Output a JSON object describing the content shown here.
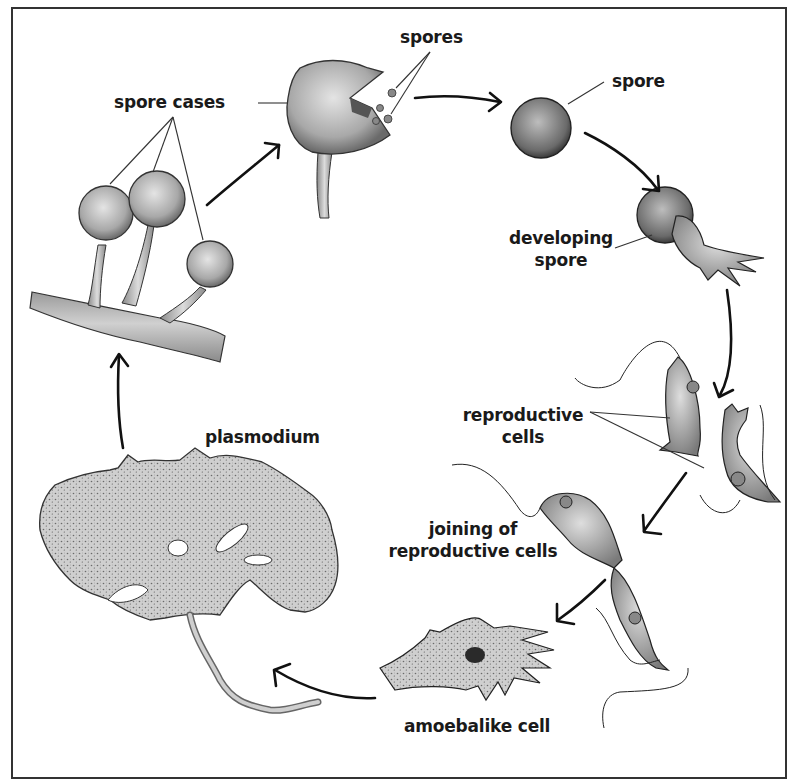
{
  "diagram": {
    "type": "life-cycle",
    "labels": {
      "spore_cases": "spore cases",
      "spores": "spores",
      "spore": "spore",
      "developing_spore_line1": "developing",
      "developing_spore_line2": "spore",
      "reproductive_cells_line1": "reproductive",
      "reproductive_cells_line2": "cells",
      "joining_line1": "joining of",
      "joining_line2": "reproductive cells",
      "amoebalike_cell": "amoebalike cell",
      "plasmodium": "plasmodium"
    },
    "stages": [
      "spore cases",
      "spores",
      "spore",
      "developing spore",
      "reproductive cells",
      "joining of reproductive cells",
      "amoebalike cell",
      "plasmodium"
    ],
    "colors": {
      "background": "#ffffff",
      "ink": "#1a1a1a",
      "illustration_fill": "#b8b8b8",
      "frame": "#333333"
    }
  }
}
